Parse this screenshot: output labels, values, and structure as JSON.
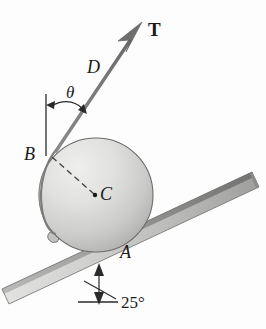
{
  "figure": {
    "type": "mechanics-free-body-diagram",
    "labels": {
      "tension_force": "T",
      "cord_point": "D",
      "cord_angle": "θ",
      "tangent_point": "B",
      "center_point": "C",
      "contact_point": "A",
      "incline_angle": "25°"
    },
    "colors": {
      "background": "#fdfdfd",
      "cylinder_light": "#e8e8e6",
      "cylinder_mid": "#cfcfcd",
      "cylinder_dark": "#a8a8a6",
      "cylinder_outline": "#6b6b6b",
      "incline_light": "#d9d9d7",
      "incline_dark": "#8f8f8d",
      "incline_edge": "#5a5a5a",
      "cord": "#7a7a7a",
      "arrow": "#6e6e6e",
      "ink": "#1a1a1a",
      "dashed": "#4a4a4a"
    },
    "geometry": {
      "cylinder_center_x": 96,
      "cylinder_center_y": 195,
      "cylinder_radius": 57,
      "incline_angle_deg": 25,
      "cord_angle_from_vertical_deg": 38
    },
    "elements": {
      "cylinder": "shaded-circle",
      "incline": "shaded-bar",
      "cord": "tangent-line-with-arrowhead",
      "radius_line": "dashed-line-B-to-C",
      "angle_marker_theta": "double-headed-arc-arrow",
      "angle_marker_incline": "double-headed-vertical-arrow-with-arc",
      "vertical_reference": "solid-vertical-line-at-B",
      "horizontal_reference": "short-solid-line-at-incline-base",
      "anchor_lug": "small-tab-on-cylinder"
    }
  }
}
